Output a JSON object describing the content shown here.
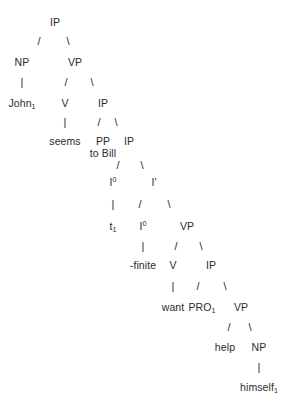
{
  "figure": {
    "kind": "syntax-tree",
    "notation": "x-bar",
    "background_color": "#ffffff",
    "text_color": "#2b2b2b",
    "sentence": "John seems to Bill -finite want PRO help himself"
  },
  "nodes": [
    {
      "id": "ip-root",
      "label": "IP",
      "x": 55,
      "y": 17
    },
    {
      "id": "np-subj",
      "label": "NP",
      "x": 22,
      "y": 57
    },
    {
      "id": "vp-1",
      "label": "VP",
      "x": 75,
      "y": 57
    },
    {
      "id": "john",
      "label": "John",
      "sub": "1",
      "x": 22,
      "y": 98
    },
    {
      "id": "v-seems",
      "label": "V",
      "x": 65,
      "y": 98
    },
    {
      "id": "ip-2",
      "label": "IP",
      "x": 103,
      "y": 98
    },
    {
      "id": "seems",
      "label": "seems",
      "x": 65,
      "y": 136
    },
    {
      "id": "pp-tobill",
      "label": "PP",
      "x": 103,
      "y": 136
    },
    {
      "id": "tobill",
      "label": "to Bill",
      "x": 103,
      "y": 148
    },
    {
      "id": "ip-3",
      "label": "IP",
      "x": 129,
      "y": 136
    },
    {
      "id": "i0-upper",
      "label": "I",
      "sup": "0",
      "x": 113,
      "y": 177
    },
    {
      "id": "i-bar",
      "label": "I'",
      "x": 154,
      "y": 177
    },
    {
      "id": "trace-t1",
      "label": "t",
      "sub": "1",
      "x": 113,
      "y": 221
    },
    {
      "id": "i0-lower",
      "label": "I",
      "sup": "0",
      "x": 143,
      "y": 221
    },
    {
      "id": "vp-2",
      "label": "VP",
      "x": 187,
      "y": 221
    },
    {
      "id": "finite",
      "label": "-finite",
      "x": 143,
      "y": 260
    },
    {
      "id": "v-want",
      "label": "V",
      "x": 173,
      "y": 260
    },
    {
      "id": "ip-4",
      "label": "IP",
      "x": 211,
      "y": 260
    },
    {
      "id": "want",
      "label": "want",
      "x": 173,
      "y": 302
    },
    {
      "id": "pro",
      "label": "PRO",
      "sub": "1",
      "x": 202,
      "y": 302
    },
    {
      "id": "vp-3",
      "label": "VP",
      "x": 241,
      "y": 302
    },
    {
      "id": "help",
      "label": "help",
      "x": 225,
      "y": 342
    },
    {
      "id": "np-obj",
      "label": "NP",
      "x": 259,
      "y": 342
    },
    {
      "id": "himself",
      "label": "himself",
      "sub": "1",
      "x": 259,
      "y": 382
    }
  ],
  "branches": [
    {
      "id": "b-ip-np",
      "glyph": "/",
      "x": 39,
      "y": 36
    },
    {
      "id": "b-ip-vp",
      "glyph": "\\",
      "x": 68,
      "y": 36
    },
    {
      "id": "b-np-john",
      "glyph": "|",
      "x": 22,
      "y": 77
    },
    {
      "id": "b-vp-v",
      "glyph": "/",
      "x": 66,
      "y": 77
    },
    {
      "id": "b-vp-ip",
      "glyph": "\\",
      "x": 92,
      "y": 77
    },
    {
      "id": "b-v-seems",
      "glyph": "|",
      "x": 65,
      "y": 117
    },
    {
      "id": "b-ip2-pp",
      "glyph": "/",
      "x": 99,
      "y": 117
    },
    {
      "id": "b-ip2-ip3",
      "glyph": "\\",
      "x": 116,
      "y": 117
    },
    {
      "id": "b-ip3-i0",
      "glyph": "/",
      "x": 118,
      "y": 160
    },
    {
      "id": "b-ip3-ibar",
      "glyph": "\\",
      "x": 142,
      "y": 160
    },
    {
      "id": "b-i0-t1",
      "glyph": "|",
      "x": 113,
      "y": 199
    },
    {
      "id": "b-ibar-i0",
      "glyph": "/",
      "x": 140,
      "y": 199
    },
    {
      "id": "b-ibar-vp",
      "glyph": "\\",
      "x": 169,
      "y": 199
    },
    {
      "id": "b-i0-finite",
      "glyph": "|",
      "x": 143,
      "y": 241
    },
    {
      "id": "b-vp2-v",
      "glyph": "/",
      "x": 176,
      "y": 241
    },
    {
      "id": "b-vp2-ip",
      "glyph": "\\",
      "x": 201,
      "y": 241
    },
    {
      "id": "b-v-want",
      "glyph": "|",
      "x": 173,
      "y": 281
    },
    {
      "id": "b-ip4-pro",
      "glyph": "/",
      "x": 198,
      "y": 281
    },
    {
      "id": "b-ip4-vp",
      "glyph": "\\",
      "x": 225,
      "y": 281
    },
    {
      "id": "b-vp3-help",
      "glyph": "/",
      "x": 229,
      "y": 322
    },
    {
      "id": "b-vp3-np",
      "glyph": "\\",
      "x": 250,
      "y": 322
    },
    {
      "id": "b-np-himself",
      "glyph": "|",
      "x": 259,
      "y": 362
    }
  ]
}
